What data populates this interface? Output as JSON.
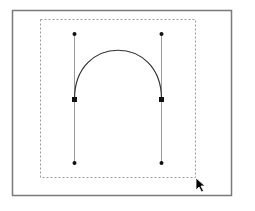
{
  "canvas": {
    "width": 255,
    "height": 211,
    "background": "#ffffff"
  },
  "frame": {
    "x": 12,
    "y": 10,
    "width": 219,
    "height": 185,
    "stroke": "#7a7a7a"
  },
  "selection_box": {
    "x": 40,
    "y": 19,
    "width": 155,
    "height": 158,
    "stroke": "#9a9a9a",
    "dash": "2,2"
  },
  "curve": {
    "type": "cubic-bezier",
    "start": [
      74,
      99
    ],
    "control1": [
      74,
      34
    ],
    "control2": [
      161,
      34
    ],
    "end": [
      161,
      99
    ],
    "stroke": "#333333"
  },
  "handles": [
    {
      "name": "left-handle",
      "from": [
        74,
        34
      ],
      "to": [
        74,
        163
      ]
    },
    {
      "name": "right-handle",
      "from": [
        161,
        34
      ],
      "to": [
        161,
        163
      ]
    }
  ],
  "handle_stroke": "#999999",
  "anchor_points": [
    {
      "name": "left-anchor",
      "x": 74,
      "y": 99
    },
    {
      "name": "right-anchor",
      "x": 161,
      "y": 99
    }
  ],
  "control_points": [
    {
      "name": "left-top-control",
      "x": 74,
      "y": 34
    },
    {
      "name": "left-bottom-control",
      "x": 74,
      "y": 163
    },
    {
      "name": "right-top-control",
      "x": 161,
      "y": 34
    },
    {
      "name": "right-bottom-control",
      "x": 161,
      "y": 163
    }
  ],
  "cursor": {
    "type": "arrow",
    "x": 196,
    "y": 178
  }
}
